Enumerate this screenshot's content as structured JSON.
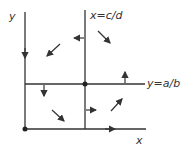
{
  "diagram": {
    "type": "phase-plane",
    "axis_labels": {
      "x": "x",
      "y": "y"
    },
    "nullclines": [
      {
        "label": "x=c/d",
        "orientation": "vertical"
      },
      {
        "label": "y=a/b",
        "orientation": "horizontal"
      }
    ],
    "equilibria": [
      "origin",
      "intersection (c/d, a/b)"
    ],
    "colors": {
      "line": "#333333",
      "background": "#ffffff"
    }
  }
}
